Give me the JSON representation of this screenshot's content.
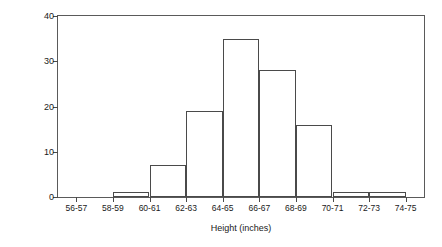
{
  "chart_data": {
    "type": "bar",
    "title": "",
    "subtitle": "",
    "xlabel": "Height (inches)",
    "ylabel": "Frequency (# of students)",
    "categories": [
      "56-57",
      "58-59",
      "60-61",
      "62-63",
      "64-65",
      "66-67",
      "68-69",
      "70-71",
      "72-73",
      "74-75"
    ],
    "values": [
      0,
      1,
      7,
      19,
      35,
      28,
      16,
      1,
      1,
      0
    ],
    "ylim": [
      0,
      40
    ],
    "yticks": [
      0,
      10,
      20,
      30,
      40
    ],
    "ytick_labels": [
      "0",
      "10",
      "20",
      "30",
      "40"
    ],
    "xtick_labels": [
      "56-57",
      "58-59",
      "60-61",
      "62-63",
      "64-65",
      "66-67",
      "68-69",
      "70-71",
      "72-73",
      "74-75"
    ],
    "grid": false,
    "legend": null,
    "legend_position": "none",
    "bar_fill_color": "#ffffff",
    "bar_edge_color": "#4a4a4a",
    "frame_color": "#5a5a5a",
    "text_color": "#1a1a1a",
    "background_color": "#ffffff",
    "annotations": [],
    "note": "Histogram of student heights; bars are drawn in the interval between adjacent x tick marks, offset one half bin to the right of each tick label."
  }
}
